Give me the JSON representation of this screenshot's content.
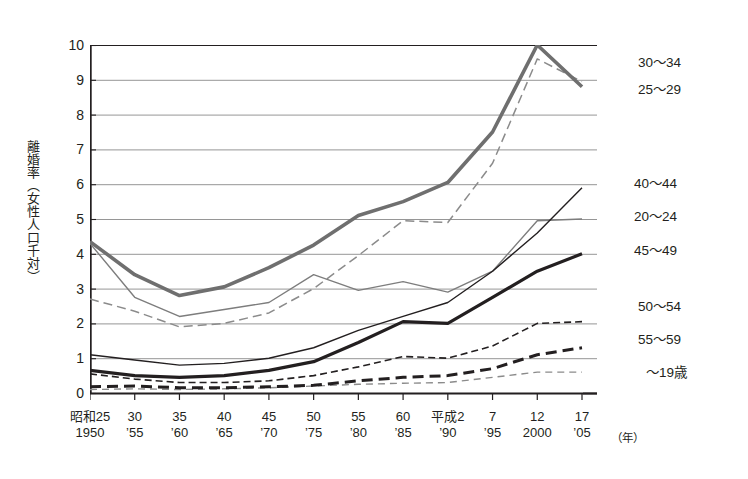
{
  "axes": {
    "y_title": "離婚率（女性人口千対）",
    "y_ticks": [
      "10",
      "9",
      "8",
      "7",
      "6",
      "5",
      "4",
      "3",
      "2",
      "1",
      "0"
    ],
    "x_unit": "（年）",
    "x_ticks": [
      {
        "era": "昭和25",
        "year": "1950"
      },
      {
        "era": "30",
        "year": "’55"
      },
      {
        "era": "35",
        "year": "’60"
      },
      {
        "era": "40",
        "year": "’65"
      },
      {
        "era": "45",
        "year": "’70"
      },
      {
        "era": "50",
        "year": "’75"
      },
      {
        "era": "55",
        "year": "’80"
      },
      {
        "era": "60",
        "year": "’85"
      },
      {
        "era": "平成2",
        "year": "’90"
      },
      {
        "era": "7",
        "year": "’95"
      },
      {
        "era": "12",
        "year": "2000"
      },
      {
        "era": "17",
        "year": "’05"
      }
    ]
  },
  "series_labels": [
    {
      "key": "a30_34",
      "text": "30〜34"
    },
    {
      "key": "a25_29",
      "text": "25〜29"
    },
    {
      "key": "a40_44",
      "text": "40〜44"
    },
    {
      "key": "a20_24",
      "text": "20〜24"
    },
    {
      "key": "a45_49",
      "text": "45〜49"
    },
    {
      "key": "a50_54",
      "text": "50〜54"
    },
    {
      "key": "a55_59",
      "text": "55〜59"
    },
    {
      "key": "a19",
      "text": "〜19歳"
    }
  ],
  "colors": {
    "ink": "#231f20",
    "gray_thick": "#6f6f6f",
    "gray_thin": "#7d7d7d",
    "grid": "#8a8a8a",
    "axis": "#231f20"
  },
  "chart_data": {
    "type": "line",
    "title": "",
    "xlabel": "（年）",
    "ylabel": "離婚率（女性人口千対）",
    "xlim": [
      1950,
      2005
    ],
    "ylim": [
      0,
      10
    ],
    "grid": true,
    "legend_position": "right-inline",
    "x": [
      1950,
      1955,
      1960,
      1965,
      1970,
      1975,
      1980,
      1985,
      1990,
      1995,
      2000,
      2005
    ],
    "series": [
      {
        "name": "25〜29",
        "style": "solid-thick-gray",
        "values": [
          4.35,
          3.4,
          2.8,
          3.05,
          3.6,
          4.25,
          5.1,
          5.5,
          6.05,
          7.5,
          10.0,
          8.8
        ]
      },
      {
        "name": "30〜34",
        "style": "dashed-gray",
        "values": [
          2.7,
          2.35,
          1.9,
          2.0,
          2.3,
          3.0,
          3.95,
          4.95,
          4.9,
          6.6,
          9.6,
          8.95
        ]
      },
      {
        "name": "20〜24",
        "style": "solid-thin-gray",
        "values": [
          4.3,
          2.75,
          2.2,
          2.4,
          2.6,
          3.4,
          2.95,
          3.2,
          2.9,
          3.5,
          4.95,
          5.0
        ]
      },
      {
        "name": "40〜44",
        "style": "solid-thin-black",
        "values": [
          1.1,
          0.95,
          0.8,
          0.85,
          1.0,
          1.3,
          1.8,
          2.2,
          2.6,
          3.5,
          4.6,
          5.9
        ]
      },
      {
        "name": "45〜49",
        "style": "solid-thick-black",
        "values": [
          0.65,
          0.5,
          0.45,
          0.5,
          0.65,
          0.9,
          1.45,
          2.05,
          2.0,
          2.75,
          3.5,
          4.0
        ]
      },
      {
        "name": "50〜54",
        "style": "dashed-black-fine",
        "values": [
          0.55,
          0.4,
          0.3,
          0.3,
          0.35,
          0.5,
          0.75,
          1.05,
          1.0,
          1.35,
          2.0,
          2.05
        ]
      },
      {
        "name": "55〜59",
        "style": "dashed-black-bold",
        "values": [
          0.18,
          0.2,
          0.15,
          0.15,
          0.18,
          0.22,
          0.35,
          0.45,
          0.5,
          0.7,
          1.1,
          1.3
        ]
      },
      {
        "name": "〜19歳",
        "style": "dashed-gray-fine",
        "values": [
          0.1,
          0.12,
          0.1,
          0.12,
          0.15,
          0.2,
          0.25,
          0.28,
          0.3,
          0.45,
          0.6,
          0.6
        ]
      }
    ]
  }
}
